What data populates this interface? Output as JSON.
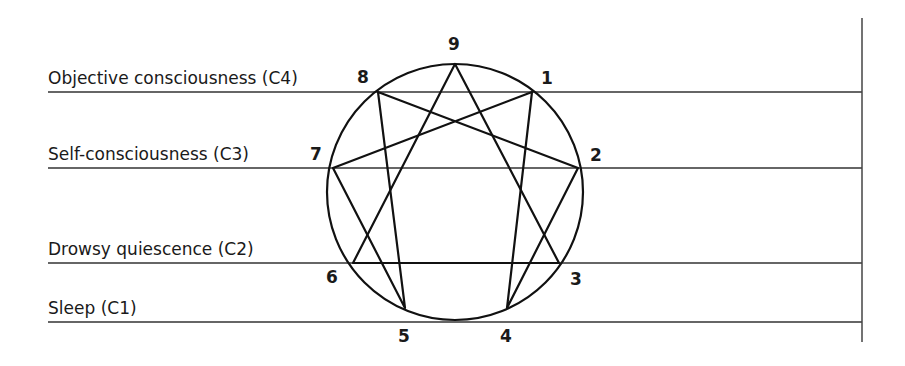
{
  "levels": [
    {
      "label": "Objective consciousness (C4)",
      "y": 92,
      "text_y": 84
    },
    {
      "label": "Self-consciousness (C3)",
      "y": 168,
      "text_y": 160
    },
    {
      "label": "Drowsy quiescence (C2)",
      "y": 263,
      "text_y": 255
    },
    {
      "label": "Sleep (C1)",
      "y": 322,
      "text_y": 314
    }
  ],
  "points": [
    {
      "id": "9",
      "label": "9",
      "x": 455,
      "y": 64,
      "lx": 448,
      "ly": 50
    },
    {
      "id": "1",
      "label": "1",
      "x": 532,
      "y": 92,
      "lx": 541,
      "ly": 84
    },
    {
      "id": "2",
      "label": "2",
      "x": 578,
      "y": 168,
      "lx": 590,
      "ly": 161
    },
    {
      "id": "3",
      "label": "3",
      "x": 559,
      "y": 263,
      "lx": 570,
      "ly": 285
    },
    {
      "id": "4",
      "label": "4",
      "x": 507,
      "y": 308,
      "lx": 500,
      "ly": 342
    },
    {
      "id": "5",
      "label": "5",
      "x": 405,
      "y": 308,
      "lx": 398,
      "ly": 342
    },
    {
      "id": "6",
      "label": "6",
      "x": 353,
      "y": 263,
      "lx": 326,
      "ly": 283
    },
    {
      "id": "7",
      "label": "7",
      "x": 333,
      "y": 168,
      "lx": 310,
      "ly": 160
    },
    {
      "id": "8",
      "label": "8",
      "x": 378,
      "y": 92,
      "lx": 357,
      "ly": 83
    }
  ],
  "circle": {
    "cx": 455,
    "cy": 192,
    "r": 128
  },
  "triangle": [
    "9",
    "3",
    "6"
  ],
  "hexad": [
    "1",
    "4",
    "2",
    "8",
    "5",
    "7"
  ],
  "frame": {
    "line_x_start": 48,
    "line_x_end": 862,
    "vline_x": 862,
    "vline_y_start": 18,
    "vline_y_end": 342
  }
}
